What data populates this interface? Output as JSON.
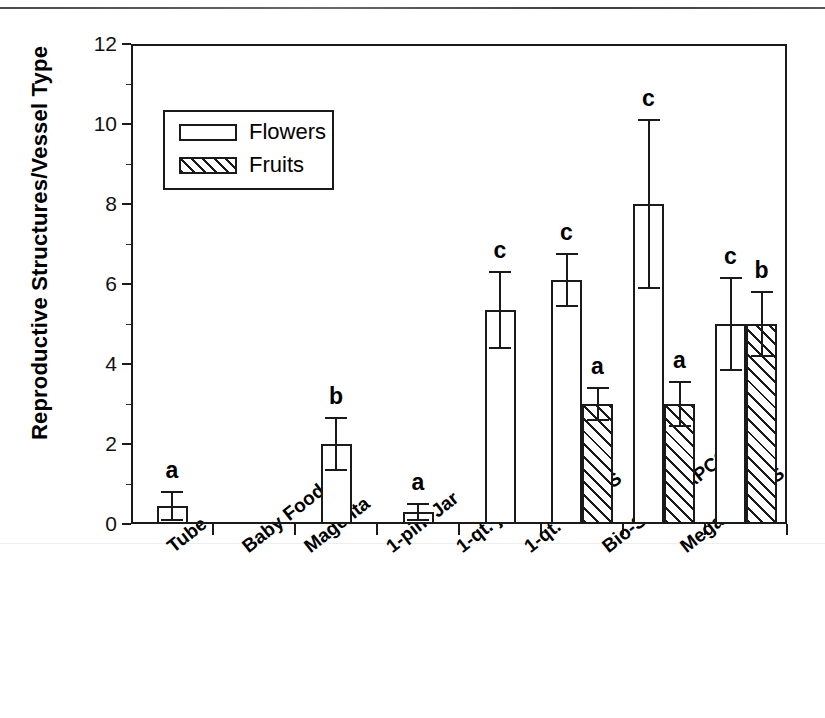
{
  "chart_data": {
    "type": "bar",
    "title": "",
    "xlabel": "",
    "ylabel": "Reproductive Structures/Vessel Type",
    "ylim": [
      0,
      12
    ],
    "ytick_labels": [
      "0",
      "2",
      "4",
      "6",
      "8",
      "10",
      "12"
    ],
    "ytick_values": [
      0,
      2,
      4,
      6,
      8,
      10,
      12
    ],
    "grid": false,
    "legend_position": "upper left",
    "categories": [
      "Tube",
      "Baby Food",
      "Magenta",
      "1-pint Jar",
      "1-qt. jar",
      "1-qt. w APCS",
      "Bio-Safe w APCS",
      "Mega w APCS"
    ],
    "series": [
      {
        "name": "Flowers",
        "values": [
          0.45,
          0,
          2.0,
          0.3,
          5.35,
          6.1,
          8.0,
          5.0
        ],
        "errors": [
          0.35,
          0,
          0.65,
          0.2,
          0.95,
          0.65,
          2.1,
          1.15
        ],
        "sig_letters": [
          "a",
          "",
          "b",
          "a",
          "c",
          "c",
          "c",
          "c"
        ]
      },
      {
        "name": "Fruits",
        "values": [
          0,
          0,
          0,
          0,
          0,
          3.0,
          3.0,
          5.0
        ],
        "errors": [
          0,
          0,
          0,
          0,
          0,
          0.4,
          0.55,
          0.8
        ],
        "sig_letters": [
          "",
          "",
          "",
          "",
          "",
          "a",
          "a",
          "b"
        ]
      }
    ],
    "legend": [
      {
        "label": "Flowers",
        "fill": "open"
      },
      {
        "label": "Fruits",
        "fill": "hatched"
      }
    ],
    "colors": {
      "outline": "#1a1a1a",
      "background": "#ffffff",
      "text": "#000000"
    }
  }
}
